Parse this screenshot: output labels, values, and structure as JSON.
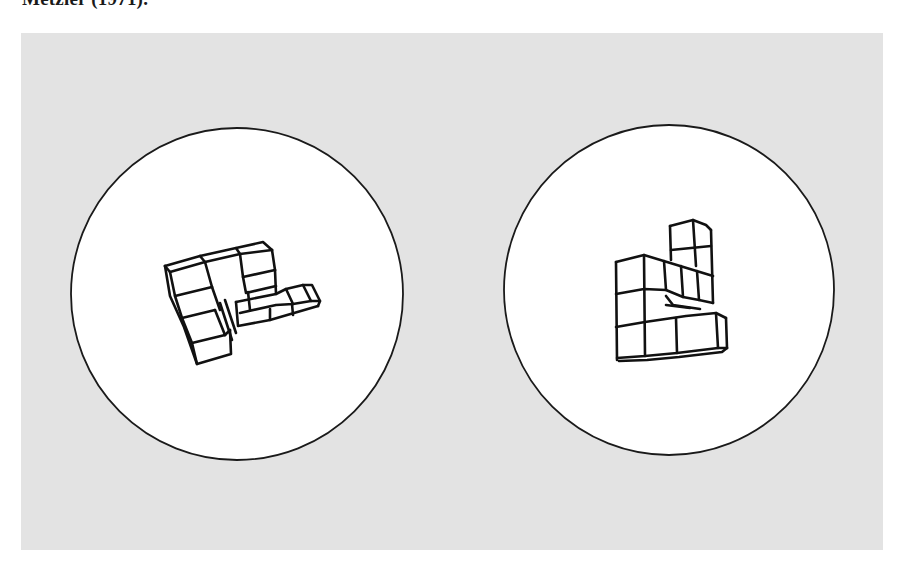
{
  "caption": {
    "fragment": "Metzler (1971)."
  },
  "figure": {
    "background_color": "#e3e3e3",
    "stimuli": [
      {
        "id": "left",
        "description": "3D cube-assembly object (Shepard-Metzler mental rotation stimulus)",
        "circle": {
          "cx": 237,
          "cy": 294,
          "r": 166
        }
      },
      {
        "id": "right",
        "description": "3D cube-assembly object (Shepard-Metzler mental rotation stimulus)",
        "circle": {
          "cx": 669,
          "cy": 290,
          "r": 165
        }
      }
    ]
  }
}
